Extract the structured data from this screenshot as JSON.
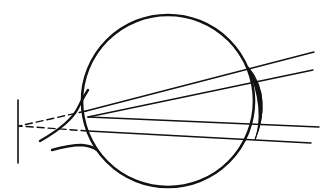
{
  "diagram": {
    "title": "",
    "colors": {
      "background": "#ffffff",
      "ink": "#111111"
    },
    "elements": {
      "eyeball": {
        "cx": 168,
        "cy": 101,
        "r": 86
      },
      "image_plane": {
        "x": 18,
        "y1": 100,
        "y2": 163
      },
      "focal_point": {
        "x": 19,
        "y": 125
      },
      "rays": [
        {
          "from": [
            313,
            52
          ],
          "to_eye": [
            88,
            112
          ]
        },
        {
          "from": [
            313,
            70
          ],
          "to_eye": [
            88,
            118
          ]
        },
        {
          "from": [
            318,
            127
          ],
          "to_eye": [
            88,
            117
          ]
        },
        {
          "from": [
            312,
            142
          ],
          "to_eye": [
            88,
            132
          ]
        }
      ],
      "lens": {
        "label": ""
      },
      "optic_nerve": {
        "label": ""
      }
    }
  }
}
